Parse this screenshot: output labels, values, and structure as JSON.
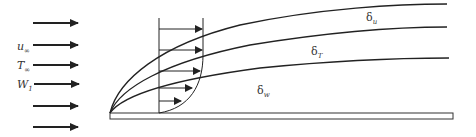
{
  "diagram": {
    "title": "",
    "inflow_labels": [
      {
        "symbol": "u",
        "subscript": "∞"
      },
      {
        "symbol": "T",
        "subscript": "∞"
      },
      {
        "symbol": "W",
        "subscript": "1"
      }
    ],
    "boundary_layers": [
      {
        "symbol": "δ",
        "subscript": "u"
      },
      {
        "symbol": "δ",
        "subscript": "T"
      },
      {
        "symbol": "δ",
        "subscript": "w"
      }
    ],
    "colors": {
      "stroke": "#222222",
      "background": "#ffffff"
    }
  }
}
